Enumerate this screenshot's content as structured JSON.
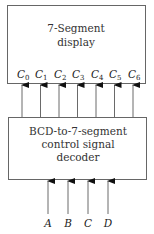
{
  "diagram": {
    "display_box": {
      "title_lines": [
        "7-Segment",
        "display"
      ],
      "outputs": [
        {
          "base": "C",
          "sub": "0"
        },
        {
          "base": "C",
          "sub": "1"
        },
        {
          "base": "C",
          "sub": "2"
        },
        {
          "base": "C",
          "sub": "3"
        },
        {
          "base": "C",
          "sub": "4"
        },
        {
          "base": "C",
          "sub": "5"
        },
        {
          "base": "C",
          "sub": "6"
        }
      ]
    },
    "decoder_box": {
      "title_lines": [
        "BCD-to-7-segment",
        "control signal",
        "decoder"
      ]
    },
    "inputs": [
      "A",
      "B",
      "C",
      "D"
    ],
    "colors": {
      "stroke": "#555555",
      "text": "#222222",
      "background": "#ffffff"
    }
  }
}
